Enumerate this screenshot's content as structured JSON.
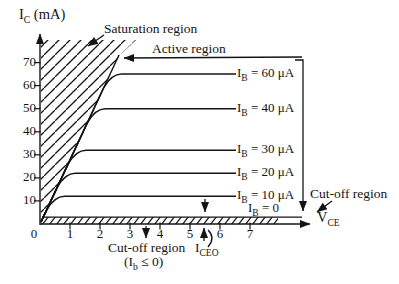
{
  "figure": {
    "y_axis_title": {
      "sym": "I",
      "sub": "C",
      "rest": " (mA)"
    },
    "x_axis_title": {
      "sym": "V",
      "sub": "CE",
      "rest": ""
    },
    "labels": {
      "saturation": "Saturation region",
      "active": "Active region",
      "cutoff_right": "Cut-off region",
      "cutoff_bottom": "Cut-off region",
      "cutoff_condition": {
        "sym": "(I",
        "sub": "b",
        "rest": " ≤ 0)"
      },
      "iceo": {
        "sym": "I",
        "sub": "CEO",
        "rest": ""
      }
    }
  },
  "chart_data": {
    "type": "line",
    "title": "",
    "xlabel": "V_CE",
    "ylabel": "I_C (mA)",
    "xlim": [
      0,
      8
    ],
    "ylim": [
      0,
      80
    ],
    "x_ticks": [
      0,
      1,
      2,
      3,
      4,
      5,
      6,
      7
    ],
    "y_ticks": [
      10,
      20,
      30,
      40,
      50,
      60,
      70
    ],
    "grid": false,
    "legend_position": "right-of-curves",
    "series": [
      {
        "name": "IB = 60 uA",
        "ib_uA": 60,
        "ic_sat_mA": 65,
        "label": {
          "sym": "I",
          "sub": "B",
          "rest": " = 60 μA"
        }
      },
      {
        "name": "IB = 40 uA",
        "ib_uA": 40,
        "ic_sat_mA": 50,
        "label": {
          "sym": "I",
          "sub": "B",
          "rest": " = 40 μA"
        }
      },
      {
        "name": "IB = 30 uA",
        "ib_uA": 30,
        "ic_sat_mA": 32,
        "label": {
          "sym": "I",
          "sub": "B",
          "rest": " = 30 μA"
        }
      },
      {
        "name": "IB = 20 uA",
        "ib_uA": 20,
        "ic_sat_mA": 22,
        "label": {
          "sym": "I",
          "sub": "B",
          "rest": " = 20 μA"
        }
      },
      {
        "name": "IB = 10 uA",
        "ib_uA": 10,
        "ic_sat_mA": 12,
        "label": {
          "sym": "I",
          "sub": "B",
          "rest": " = 10 μA"
        }
      },
      {
        "name": "IB = 0",
        "ib_uA": 0,
        "ic_sat_mA": 3,
        "label": {
          "sym": "I",
          "sub": "B",
          "rest": " = 0"
        }
      }
    ],
    "annotations": [
      "Saturation region",
      "Active region",
      "Cut-off region",
      "Cut-off region (Ib ≤ 0)",
      "I_CEO"
    ]
  }
}
